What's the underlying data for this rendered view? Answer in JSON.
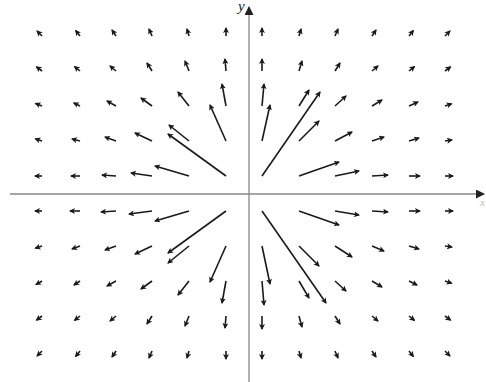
{
  "chart_data": {
    "type": "vector_field",
    "title": "",
    "xlabel": "x",
    "ylabel": "y",
    "grid": {
      "columns_px": [
        42,
        80,
        116,
        152,
        189,
        226,
        262,
        299,
        335,
        372,
        409,
        445
      ],
      "rows_px": [
        36,
        71,
        106,
        141,
        176,
        211,
        246,
        281,
        316,
        351
      ]
    },
    "origin_px": [
      249,
      194
    ],
    "axes": {
      "x_axis": {
        "y": 194,
        "x_start": 10,
        "x_end": 484,
        "arrow": "right"
      },
      "y_axis": {
        "x": 249,
        "y_start": 7,
        "y_end": 382,
        "arrow": "top"
      }
    },
    "arrows_px": [
      [
        42,
        36,
        -4,
        -4
      ],
      [
        80,
        36,
        -4,
        -5
      ],
      [
        116,
        36,
        -4,
        -6
      ],
      [
        152,
        36,
        -3,
        -7
      ],
      [
        189,
        36,
        -2,
        -7
      ],
      [
        226,
        36,
        0,
        -8
      ],
      [
        42,
        71,
        -4,
        -3
      ],
      [
        80,
        71,
        -5,
        -4
      ],
      [
        116,
        71,
        -6,
        -5
      ],
      [
        152,
        71,
        -5,
        -8
      ],
      [
        189,
        71,
        -4,
        -10
      ],
      [
        226,
        71,
        -1,
        -12
      ],
      [
        42,
        106,
        -5,
        -2
      ],
      [
        80,
        106,
        -6,
        -3
      ],
      [
        116,
        106,
        -9,
        -5
      ],
      [
        152,
        106,
        -11,
        -8
      ],
      [
        189,
        106,
        -11,
        -14
      ],
      [
        226,
        106,
        -4,
        -22
      ],
      [
        42,
        141,
        -6,
        -2
      ],
      [
        80,
        141,
        -8,
        -2
      ],
      [
        116,
        141,
        -11,
        -4
      ],
      [
        152,
        141,
        -17,
        -8
      ],
      [
        189,
        141,
        -20,
        -16
      ],
      [
        226,
        141,
        -16,
        -36
      ],
      [
        42,
        176,
        -6,
        0
      ],
      [
        80,
        176,
        -9,
        0
      ],
      [
        116,
        176,
        -14,
        -1
      ],
      [
        152,
        176,
        -21,
        -3
      ],
      [
        189,
        176,
        -34,
        -10
      ],
      [
        226,
        176,
        -58,
        -42
      ],
      [
        262,
        36,
        0,
        -8
      ],
      [
        299,
        36,
        2,
        -7
      ],
      [
        335,
        36,
        3,
        -7
      ],
      [
        372,
        36,
        4,
        -6
      ],
      [
        409,
        36,
        4,
        -5
      ],
      [
        445,
        36,
        4,
        -4
      ],
      [
        262,
        71,
        0,
        -12
      ],
      [
        299,
        71,
        3,
        -10
      ],
      [
        335,
        71,
        5,
        -8
      ],
      [
        372,
        71,
        6,
        -5
      ],
      [
        409,
        71,
        5,
        -4
      ],
      [
        445,
        71,
        4,
        -3
      ],
      [
        262,
        106,
        2,
        -22
      ],
      [
        299,
        106,
        10,
        -16
      ],
      [
        335,
        106,
        11,
        -10
      ],
      [
        372,
        106,
        10,
        -6
      ],
      [
        409,
        106,
        9,
        -4
      ],
      [
        445,
        106,
        6,
        -2
      ],
      [
        262,
        141,
        8,
        -36
      ],
      [
        299,
        141,
        20,
        -20
      ],
      [
        335,
        141,
        17,
        -9
      ],
      [
        372,
        141,
        12,
        -4
      ],
      [
        409,
        141,
        10,
        -3
      ],
      [
        445,
        141,
        7,
        -1
      ],
      [
        262,
        176,
        58,
        -84
      ],
      [
        299,
        176,
        40,
        -14
      ],
      [
        335,
        176,
        24,
        -5
      ],
      [
        372,
        176,
        16,
        -1
      ],
      [
        409,
        176,
        11,
        0
      ],
      [
        445,
        176,
        8,
        0
      ],
      [
        42,
        211,
        -6,
        0
      ],
      [
        80,
        211,
        -10,
        0
      ],
      [
        116,
        211,
        -15,
        1
      ],
      [
        152,
        211,
        -23,
        3
      ],
      [
        189,
        211,
        -34,
        10
      ],
      [
        226,
        211,
        -58,
        42
      ],
      [
        42,
        246,
        -6,
        2
      ],
      [
        80,
        246,
        -8,
        3
      ],
      [
        116,
        246,
        -11,
        4
      ],
      [
        152,
        246,
        -17,
        8
      ],
      [
        189,
        246,
        -21,
        17
      ],
      [
        226,
        246,
        -16,
        36
      ],
      [
        42,
        281,
        -5,
        3
      ],
      [
        80,
        281,
        -6,
        4
      ],
      [
        116,
        281,
        -9,
        5
      ],
      [
        152,
        281,
        -11,
        8
      ],
      [
        189,
        281,
        -11,
        14
      ],
      [
        226,
        281,
        -4,
        22
      ],
      [
        42,
        316,
        -4,
        3
      ],
      [
        80,
        316,
        -5,
        4
      ],
      [
        116,
        316,
        -6,
        5
      ],
      [
        152,
        316,
        -5,
        8
      ],
      [
        189,
        316,
        -4,
        10
      ],
      [
        226,
        316,
        -1,
        12
      ],
      [
        42,
        351,
        -4,
        4
      ],
      [
        80,
        351,
        -4,
        5
      ],
      [
        116,
        351,
        -4,
        6
      ],
      [
        152,
        351,
        -3,
        7
      ],
      [
        189,
        351,
        -2,
        7
      ],
      [
        226,
        351,
        0,
        8
      ],
      [
        262,
        211,
        64,
        92
      ],
      [
        299,
        211,
        40,
        14
      ],
      [
        335,
        211,
        24,
        4
      ],
      [
        372,
        211,
        16,
        1
      ],
      [
        409,
        211,
        11,
        0
      ],
      [
        445,
        211,
        8,
        0
      ],
      [
        262,
        246,
        8,
        38
      ],
      [
        299,
        246,
        20,
        20
      ],
      [
        335,
        246,
        17,
        11
      ],
      [
        372,
        246,
        12,
        5
      ],
      [
        409,
        246,
        10,
        3
      ],
      [
        445,
        246,
        7,
        1
      ],
      [
        262,
        281,
        2,
        24
      ],
      [
        299,
        281,
        10,
        17
      ],
      [
        335,
        281,
        11,
        10
      ],
      [
        372,
        281,
        10,
        6
      ],
      [
        409,
        281,
        8,
        4
      ],
      [
        445,
        281,
        6,
        2
      ],
      [
        262,
        316,
        0,
        13
      ],
      [
        299,
        316,
        3,
        11
      ],
      [
        335,
        316,
        5,
        8
      ],
      [
        372,
        316,
        6,
        5
      ],
      [
        409,
        316,
        5,
        4
      ],
      [
        445,
        316,
        4,
        3
      ],
      [
        262,
        351,
        0,
        8
      ],
      [
        299,
        351,
        2,
        7
      ],
      [
        335,
        351,
        3,
        7
      ],
      [
        372,
        351,
        4,
        6
      ],
      [
        409,
        351,
        4,
        5
      ],
      [
        445,
        351,
        4,
        4
      ]
    ],
    "arrow_color": "#1a1a1a",
    "axis_color": "#888888"
  }
}
